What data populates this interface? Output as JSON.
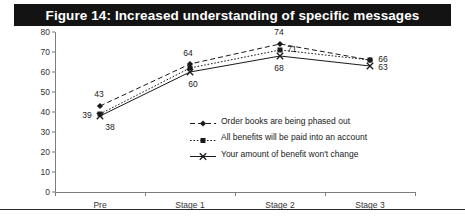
{
  "figure": {
    "title": "Figure 14: Increased understanding of specific messages",
    "title_bar_color": "#131313",
    "title_text_color": "#ffffff",
    "background_color": "#ffffff"
  },
  "chart_data": {
    "type": "line",
    "title": "Figure 14: Increased understanding of specific messages",
    "xlabel": "",
    "ylabel": "",
    "categories": [
      "Pre",
      "Stage 1",
      "Stage 2",
      "Stage 3"
    ],
    "ylim": [
      0,
      80
    ],
    "yticks": [
      0,
      10,
      20,
      30,
      40,
      50,
      60,
      70,
      80
    ],
    "grid": false,
    "legend_position": "center",
    "series": [
      {
        "name": "Order books are being phased out",
        "values": [
          43,
          64,
          74,
          66
        ],
        "marker": "filled-diamond",
        "line_style": "dashed",
        "color": "#1a1a1a"
      },
      {
        "name": "All benefits will be paid into an account",
        "values": [
          39,
          62,
          71,
          66
        ],
        "marker": "filled-square",
        "line_style": "dotted",
        "color": "#1a1a1a"
      },
      {
        "name": "Your amount of benefit won't change",
        "values": [
          38,
          60,
          68,
          63
        ],
        "marker": "cross-x",
        "line_style": "solid",
        "color": "#1a1a1a"
      }
    ],
    "point_labels": [
      {
        "text": "43",
        "category": "Pre",
        "value": 43
      },
      {
        "text": "39",
        "category": "Pre",
        "value": 39
      },
      {
        "text": "38",
        "category": "Pre",
        "value": 38
      },
      {
        "text": "64",
        "category": "Stage 1",
        "value": 64
      },
      {
        "text": "60",
        "category": "Stage 1",
        "value": 60
      },
      {
        "text": "74",
        "category": "Stage 2",
        "value": 74
      },
      {
        "text": "71",
        "category": "Stage 2",
        "value": 71
      },
      {
        "text": "68",
        "category": "Stage 2",
        "value": 68
      },
      {
        "text": "66",
        "category": "Stage 3",
        "value": 66
      },
      {
        "text": "63",
        "category": "Stage 3",
        "value": 63
      }
    ]
  }
}
